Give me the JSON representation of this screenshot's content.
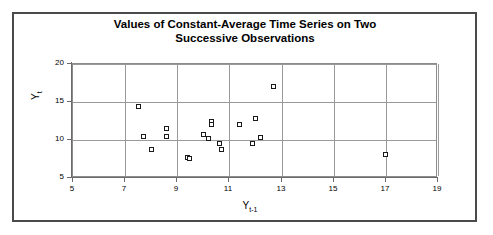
{
  "chart_data": {
    "type": "scatter",
    "title": "Values of Constant-Average Time Series on Two Successive Observations",
    "title_line1": "Values of Constant-Average Time Series on Two",
    "title_line2": "Successive Observations",
    "xlabel": "Y",
    "xlabel_sub": "t-1",
    "ylabel": "Y",
    "ylabel_sub": "t",
    "xlim": [
      5,
      19
    ],
    "ylim": [
      5,
      20
    ],
    "xticks": [
      5,
      7,
      9,
      11,
      13,
      15,
      17,
      19
    ],
    "yticks": [
      5,
      10,
      15,
      20
    ],
    "grid": true,
    "legend": null,
    "marker_style": "open-square",
    "marker_color": "#1a1a1a",
    "points": [
      {
        "x": 7.5,
        "y": 14.4
      },
      {
        "x": 7.7,
        "y": 10.4
      },
      {
        "x": 8.0,
        "y": 8.7
      },
      {
        "x": 8.6,
        "y": 11.5
      },
      {
        "x": 8.6,
        "y": 10.5
      },
      {
        "x": 9.4,
        "y": 7.7
      },
      {
        "x": 9.45,
        "y": 7.6
      },
      {
        "x": 10.0,
        "y": 10.7
      },
      {
        "x": 10.3,
        "y": 12.5
      },
      {
        "x": 10.3,
        "y": 12.1
      },
      {
        "x": 10.2,
        "y": 10.2
      },
      {
        "x": 10.6,
        "y": 9.6
      },
      {
        "x": 10.7,
        "y": 8.7
      },
      {
        "x": 11.4,
        "y": 12.1
      },
      {
        "x": 11.9,
        "y": 9.6
      },
      {
        "x": 12.0,
        "y": 12.8
      },
      {
        "x": 12.2,
        "y": 10.3
      },
      {
        "x": 12.7,
        "y": 17.1
      },
      {
        "x": 17.0,
        "y": 8.1
      }
    ]
  },
  "colors": {
    "frame": "#4a4a4a",
    "grid": "#9a9a9a",
    "axis": "#6b6b6b",
    "text": "#000000",
    "background": "#ffffff"
  }
}
